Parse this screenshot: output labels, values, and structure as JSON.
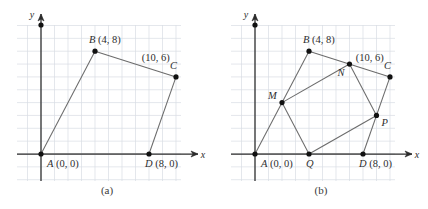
{
  "figure": {
    "background_color": "#ffffff",
    "grid_color": "#d8dde4",
    "axis_color": "#2b2b2b",
    "shape_color": "#6b6b6b",
    "point_color": "#111111",
    "label_color": "#2e2e2e"
  },
  "geometry": {
    "units_per_cell": 1,
    "x_unit_px": 13.5,
    "y_unit_px": 12.85,
    "origin_px": {
      "x": 41,
      "y": 154
    },
    "grid": {
      "left_px": 17,
      "right_px": 181,
      "top_px": 25,
      "bottom_px": 181
    }
  },
  "panels": [
    {
      "id": "a",
      "caption": "(a)",
      "axes": {
        "x_label": "x",
        "y_label": "y"
      },
      "vertices": [
        {
          "name": "A",
          "label": "A (0, 0)",
          "x": 0,
          "y": 0,
          "label_dx": 6,
          "label_dy": 13
        },
        {
          "name": "B",
          "label": "B (4, 8)",
          "x": 4,
          "y": 8,
          "label_dx": -6,
          "label_dy": -8
        },
        {
          "name": "C",
          "label": "C",
          "x": 10,
          "y": 6,
          "label_dx": -6,
          "label_dy": -8
        },
        {
          "name": "D",
          "label": "D (8, 0)",
          "x": 8,
          "y": 0,
          "label_dx": -4,
          "label_dy": 13
        }
      ],
      "annotations": [
        {
          "name": "c-coordinates",
          "text": "(10, 6)",
          "x": 8.5,
          "y": 7.2
        }
      ],
      "edges": [
        {
          "from": "A",
          "to": "B"
        },
        {
          "from": "B",
          "to": "C"
        },
        {
          "from": "C",
          "to": "D"
        },
        {
          "from": "D",
          "to": "A"
        }
      ]
    },
    {
      "id": "b",
      "caption": "(b)",
      "axes": {
        "x_label": "x",
        "y_label": "y"
      },
      "vertices": [
        {
          "name": "A",
          "label": "A (0, 0)",
          "x": 0,
          "y": 0,
          "label_dx": 6,
          "label_dy": 13
        },
        {
          "name": "B",
          "label": "B (4, 8)",
          "x": 4,
          "y": 8,
          "label_dx": -6,
          "label_dy": -8
        },
        {
          "name": "C",
          "label": "C",
          "x": 10,
          "y": 6,
          "label_dx": -6,
          "label_dy": -8
        },
        {
          "name": "D",
          "label": "D (8, 0)",
          "x": 8,
          "y": 0,
          "label_dx": -4,
          "label_dy": 13
        },
        {
          "name": "M",
          "label": "M",
          "x": 2,
          "y": 4,
          "label_dx": -14,
          "label_dy": -4
        },
        {
          "name": "N",
          "label": "N",
          "x": 7,
          "y": 7,
          "label_dx": -12,
          "label_dy": 12
        },
        {
          "name": "P",
          "label": "P",
          "x": 9,
          "y": 3,
          "label_dx": 5,
          "label_dy": 11
        },
        {
          "name": "Q",
          "label": "Q",
          "x": 4,
          "y": 0,
          "label_dx": -3,
          "label_dy": 13
        }
      ],
      "annotations": [
        {
          "name": "c-coordinates",
          "text": "(10, 6)",
          "x": 8.5,
          "y": 7.2
        }
      ],
      "edges": [
        {
          "from": "A",
          "to": "B"
        },
        {
          "from": "B",
          "to": "C"
        },
        {
          "from": "C",
          "to": "D"
        },
        {
          "from": "D",
          "to": "A"
        },
        {
          "from": "M",
          "to": "N"
        },
        {
          "from": "N",
          "to": "P"
        },
        {
          "from": "P",
          "to": "Q"
        },
        {
          "from": "Q",
          "to": "M"
        }
      ]
    }
  ]
}
